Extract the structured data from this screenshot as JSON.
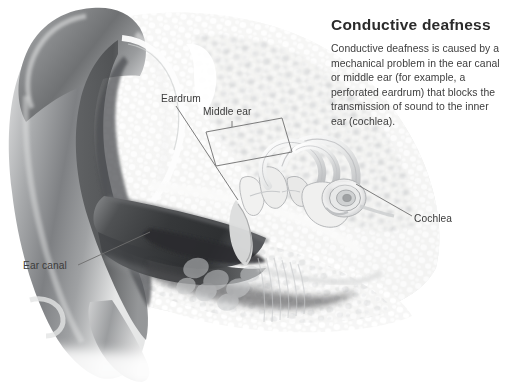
{
  "canvas": {
    "width": 506,
    "height": 384,
    "background": "#ffffff"
  },
  "panel": {
    "title": "Conductive deafness",
    "body": "Conductive deafness is caused by a mechanical problem in the ear canal or middle ear (for example, a perforated eardrum) that blocks the transmission of sound to the inner ear (cochlea)."
  },
  "labels": {
    "eardrum": "Eardrum",
    "middle_ear": "Middle ear",
    "cochlea": "Cochlea",
    "ear_canal": "Ear canal"
  },
  "illustration": {
    "subject": "cross-section of the human ear",
    "style": "grayscale airbrush medical illustration",
    "parts": [
      "pinna-outer-ear",
      "ear-canal",
      "eardrum",
      "middle-ear-ossicles",
      "semicircular-canals",
      "cochlea",
      "mastoid-bone-air-cells"
    ]
  },
  "colors": {
    "background": "#ffffff",
    "title_text": "#2b2b2b",
    "body_text": "#3d3d3d",
    "label_text": "#3b3b3b",
    "leader_line": "#6e6e6e",
    "bracket_line": "#6e6e6e",
    "cartilage_dark": "#6f7072",
    "cartilage_mid": "#9c9da0",
    "canal_shadow": "#3a3b3d",
    "bone_light": "#f4f4f3",
    "bone_cell": "#b9bbbd"
  }
}
